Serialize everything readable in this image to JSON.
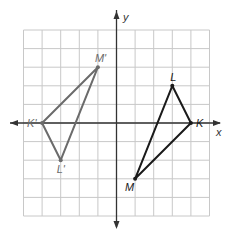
{
  "graph": {
    "x_axis_label": "x",
    "y_axis_label": "y",
    "grid": {
      "xmin": -5,
      "xmax": 5,
      "ymin": -5,
      "ymax": 5,
      "origin_px": [
        116.5,
        123
      ],
      "cell_px": 18.6
    },
    "colors": {
      "grid": "#c8c8c8",
      "axis": "#333333",
      "image_triangle": "#6b6b6b",
      "preimage_triangle": "#1a1a1a"
    }
  },
  "triangles": [
    {
      "name": "preimage",
      "vertices": [
        {
          "label": "K",
          "x": 4,
          "y": 0
        },
        {
          "label": "L",
          "x": 3,
          "y": 2
        },
        {
          "label": "M",
          "x": 1,
          "y": -3
        }
      ]
    },
    {
      "name": "image",
      "vertices": [
        {
          "label": "K'",
          "x": -4,
          "y": 0
        },
        {
          "label": "L'",
          "x": -3,
          "y": -2
        },
        {
          "label": "M'",
          "x": -1,
          "y": 3
        }
      ]
    }
  ]
}
